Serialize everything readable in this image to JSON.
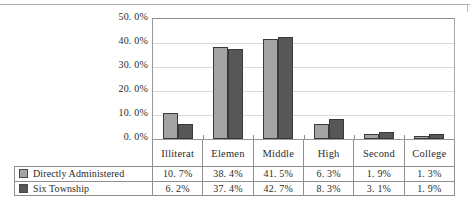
{
  "chart_data": {
    "type": "bar",
    "title": "",
    "xlabel": "",
    "ylabel": "",
    "ylim": [
      0,
      50
    ],
    "grid": true,
    "legend_position": "table-left",
    "categories": [
      "Illiterat",
      "Elemen",
      "Middle",
      "High",
      "Second",
      "College"
    ],
    "y_ticks": [
      "0. 0%",
      "10. 0%",
      "20. 0%",
      "30. 0%",
      "40. 0%",
      "50. 0%"
    ],
    "y_tick_values": [
      0,
      10,
      20,
      30,
      40,
      50
    ],
    "series": [
      {
        "name": "Directly Administered",
        "color": "#a3a3a3",
        "values": [
          10.7,
          38.4,
          41.5,
          6.3,
          1.9,
          1.3
        ],
        "labels": [
          "10. 7%",
          "38. 4%",
          "41. 5%",
          "6. 3%",
          "1. 9%",
          "1. 3%"
        ]
      },
      {
        "name": "Six Township",
        "color": "#575757",
        "values": [
          6.2,
          37.4,
          42.7,
          8.3,
          3.1,
          1.9
        ],
        "labels": [
          "6. 2%",
          "37. 4%",
          "42. 7%",
          "8. 3%",
          "3. 1%",
          "1. 9%"
        ]
      }
    ]
  }
}
